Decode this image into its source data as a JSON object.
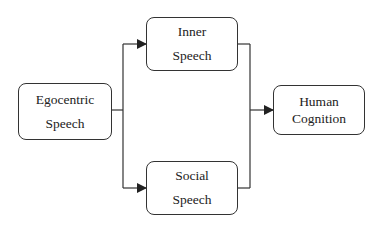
{
  "diagram": {
    "type": "flow",
    "nodes": [
      {
        "id": "egocentric",
        "lines": [
          "Egocentric",
          "Speech"
        ]
      },
      {
        "id": "inner",
        "lines": [
          "Inner",
          "Speech"
        ]
      },
      {
        "id": "social",
        "lines": [
          "Social",
          "Speech"
        ]
      },
      {
        "id": "human",
        "lines": [
          "Human",
          "Cognition"
        ]
      }
    ],
    "edges": [
      {
        "from": "egocentric",
        "to": "inner"
      },
      {
        "from": "egocentric",
        "to": "social"
      },
      {
        "from": "inner",
        "to": "human"
      },
      {
        "from": "social",
        "to": "human"
      }
    ],
    "colors": {
      "stroke": "#333333",
      "background": "#ffffff",
      "text": "#222222"
    }
  }
}
